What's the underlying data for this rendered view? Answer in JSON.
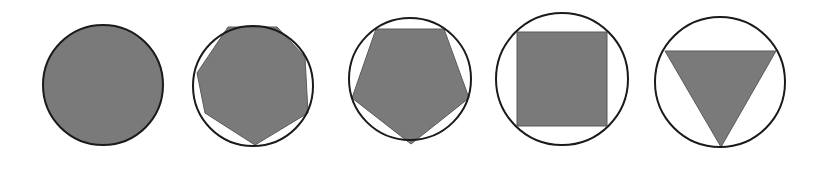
{
  "diagram": {
    "title": "",
    "colors": {
      "background": "#ffffff",
      "fill": "#7a7a7a",
      "stroke": "#1a1a1a"
    },
    "figures": [
      {
        "name": "circle-filled",
        "circle": {
          "cx": 103,
          "cy": 85,
          "r": 60,
          "filled": true
        },
        "polygon": null
      },
      {
        "name": "heptagon-in-circle",
        "sides": 7,
        "circle": {
          "cx": 253,
          "cy": 86,
          "r": 60,
          "filled": false
        },
        "polygon": "228,27 277,27 305,57 308,113 255,145 205,113 197,73"
      },
      {
        "name": "pentagon-in-circle",
        "sides": 5,
        "circle": {
          "cx": 410,
          "cy": 79,
          "r": 61,
          "filled": false
        },
        "polygon": "376,29 444,29 469,98 411,144 352,98"
      },
      {
        "name": "square-in-circle",
        "sides": 4,
        "circle": {
          "cx": 562,
          "cy": 79,
          "r": 66,
          "filled": false
        },
        "polygon": "517,32 607,32 607,126 517,126"
      },
      {
        "name": "triangle-in-circle",
        "sides": 3,
        "circle": {
          "cx": 720,
          "cy": 82,
          "r": 65,
          "filled": false
        },
        "polygon": "665,51 776,51 721,147"
      }
    ]
  }
}
